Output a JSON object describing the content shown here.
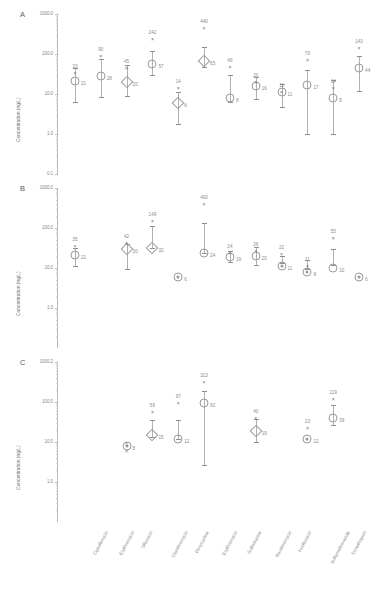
{
  "figure": {
    "ylabel": "Concentration (ng/L)",
    "categories": [
      "Ciprofloxacin",
      "Erythromycin",
      "Ofloxacin",
      "Clarithromycin",
      "Doxycycline",
      "Erythromycin",
      "Sulfadiazine",
      "Roxithromycin",
      "Norfloxacin",
      "Sulfamethoxazole",
      "Trimethoprim",
      "Oxytetracycline"
    ],
    "yticks": [
      "1000.0",
      "100.0",
      "10.0",
      "1.0",
      "0.1"
    ],
    "ytick_values": [
      1000.0,
      100.0,
      10.0,
      1.0,
      0.1
    ]
  },
  "chart_data": {
    "type": "scatter",
    "title": "",
    "xlabel": "",
    "ylabel": "Concentration (ng/L)",
    "scale": "log",
    "ylim": [
      0.1,
      1000.0
    ],
    "categories": [
      "Ciprofloxacin",
      "Erythromycin",
      "Ofloxacin",
      "Clarithromycin",
      "Doxycycline",
      "Erythromycin",
      "Sulfadiazine",
      "Roxithromycin",
      "Norfloxacin",
      "Sulfamethoxazole",
      "Trimethoprim",
      "Oxytetracycline"
    ],
    "panels": [
      {
        "letter": "A",
        "ylabel": "Concentration (ng/L)",
        "yticks": [
          "1000.0",
          "100.0",
          "10.0",
          "1.0",
          "0.1"
        ],
        "points": [
          {
            "category": "Ciprofloxacin",
            "mean": 33,
            "median": 21,
            "low": 6.2,
            "high": 45,
            "marker": "circle"
          },
          {
            "category": "Erythromycin",
            "mean": 90,
            "median": 28,
            "low": 8.5,
            "high": 75,
            "marker": "circle"
          },
          {
            "category": "Ofloxacin",
            "mean": 45,
            "median": 20,
            "low": 9.0,
            "high": 52,
            "marker": "diamond"
          },
          {
            "category": "Clarithromycin",
            "mean": 242,
            "median": 57,
            "low": 30,
            "high": 120,
            "marker": "circle"
          },
          {
            "category": "Doxycycline",
            "mean": 14,
            "median": 6,
            "low": 1.8,
            "high": 11,
            "marker": "diamond"
          },
          {
            "category": "Erythromycin",
            "mean": 440,
            "median": 65,
            "low": 48,
            "high": 150,
            "marker": "diamond"
          },
          {
            "category": "Sulfadiazine",
            "mean": 46,
            "median": 8,
            "low": 6.2,
            "high": 30,
            "marker": "circle"
          },
          {
            "category": "Roxithromycin",
            "mean": 20,
            "median": 16,
            "low": 7.4,
            "high": 26,
            "marker": "circle"
          },
          {
            "category": "Norfloxacin",
            "mean": 11,
            "median": 11,
            "low": 4.8,
            "high": 18,
            "marker": "circle"
          },
          {
            "category": "Sulfamethoxazole",
            "mean": 70,
            "median": 17,
            "low": 1.0,
            "high": 39,
            "marker": "circle"
          },
          {
            "category": "Trimethoprim",
            "mean": 14,
            "median": 8,
            "low": 1.0,
            "high": 23,
            "marker": "circle"
          },
          {
            "category": "Oxytetracycline",
            "mean": 143,
            "median": 44,
            "low": 12,
            "high": 90,
            "marker": "circle"
          }
        ]
      },
      {
        "letter": "B",
        "ylabel": "Concentration (ng/L)",
        "yticks": [
          "1000.0",
          "100.0",
          "10.0",
          "1.0"
        ],
        "points": [
          {
            "category": "Ciprofloxacin",
            "mean": 35,
            "median": 21,
            "low": 11,
            "high": 32,
            "marker": "circle"
          },
          {
            "category": "Erythromycin",
            "mean": null,
            "median": null,
            "low": null,
            "high": null,
            "marker": "none"
          },
          {
            "category": "Ofloxacin",
            "mean": 42,
            "median": 30,
            "low": 9.5,
            "high": 40,
            "marker": "diamond"
          },
          {
            "category": "Clarithromycin",
            "mean": 149,
            "median": 32,
            "low": 32,
            "high": 110,
            "marker": "diamond"
          },
          {
            "category": "Doxycycline",
            "mean": null,
            "median": 6,
            "low": null,
            "high": null,
            "marker": "target"
          },
          {
            "category": "Erythromycin",
            "mean": 400,
            "median": 24,
            "low": 24,
            "high": 130,
            "marker": "circle"
          },
          {
            "category": "Sulfadiazine",
            "mean": 24,
            "median": 19,
            "low": 14,
            "high": 26,
            "marker": "circle"
          },
          {
            "category": "Roxithromycin",
            "mean": 26,
            "median": 20,
            "low": 12,
            "high": 33,
            "marker": "circle"
          },
          {
            "category": "Norfloxacin",
            "mean": 22,
            "median": 11,
            "low": 13,
            "high": 20,
            "marker": "target"
          },
          {
            "category": "Sulfamethoxazole",
            "mean": 11,
            "median": 8,
            "low": 9.5,
            "high": 16,
            "marker": "target"
          },
          {
            "category": "Trimethoprim",
            "mean": 55,
            "median": 10,
            "low": 12,
            "high": 30,
            "marker": "circle"
          },
          {
            "category": "Oxytetracycline",
            "mean": null,
            "median": 6,
            "low": null,
            "high": null,
            "marker": "target"
          }
        ]
      },
      {
        "letter": "C",
        "ylabel": "Concentration (ng/L)",
        "yticks": [
          "1000.2",
          "100.0",
          "10.0",
          "1.0"
        ],
        "points": [
          {
            "category": "Ciprofloxacin",
            "mean": null,
            "median": null,
            "low": null,
            "high": null,
            "marker": "none"
          },
          {
            "category": "Erythromycin",
            "mean": null,
            "median": null,
            "low": null,
            "high": null,
            "marker": "none"
          },
          {
            "category": "Ofloxacin",
            "mean": 6,
            "median": 8,
            "low": null,
            "high": null,
            "marker": "target"
          },
          {
            "category": "Clarithromycin",
            "mean": 56,
            "median": 15,
            "low": 13,
            "high": 36,
            "marker": "diamond"
          },
          {
            "category": "Doxycycline",
            "mean": 97,
            "median": 12,
            "low": 12,
            "high": 36,
            "marker": "circle"
          },
          {
            "category": "Erythromycin",
            "mean": 313,
            "median": 92,
            "low": 2.6,
            "high": 190,
            "marker": "circle"
          },
          {
            "category": "Sulfadiazine",
            "mean": null,
            "median": null,
            "low": null,
            "high": null,
            "marker": "none"
          },
          {
            "category": "Roxithromycin",
            "mean": 40,
            "median": 19,
            "low": 10,
            "high": 37,
            "marker": "diamond"
          },
          {
            "category": "Norfloxacin",
            "mean": null,
            "median": null,
            "low": null,
            "high": null,
            "marker": "none"
          },
          {
            "category": "Sulfamethoxazole",
            "mean": 23,
            "median": 12,
            "low": null,
            "high": null,
            "marker": "target"
          },
          {
            "category": "Trimethoprim",
            "mean": 119,
            "median": 39,
            "low": 27,
            "high": 85,
            "marker": "circle"
          },
          {
            "category": "Oxytetracycline",
            "mean": null,
            "median": null,
            "low": null,
            "high": null,
            "marker": "none"
          }
        ]
      }
    ]
  }
}
